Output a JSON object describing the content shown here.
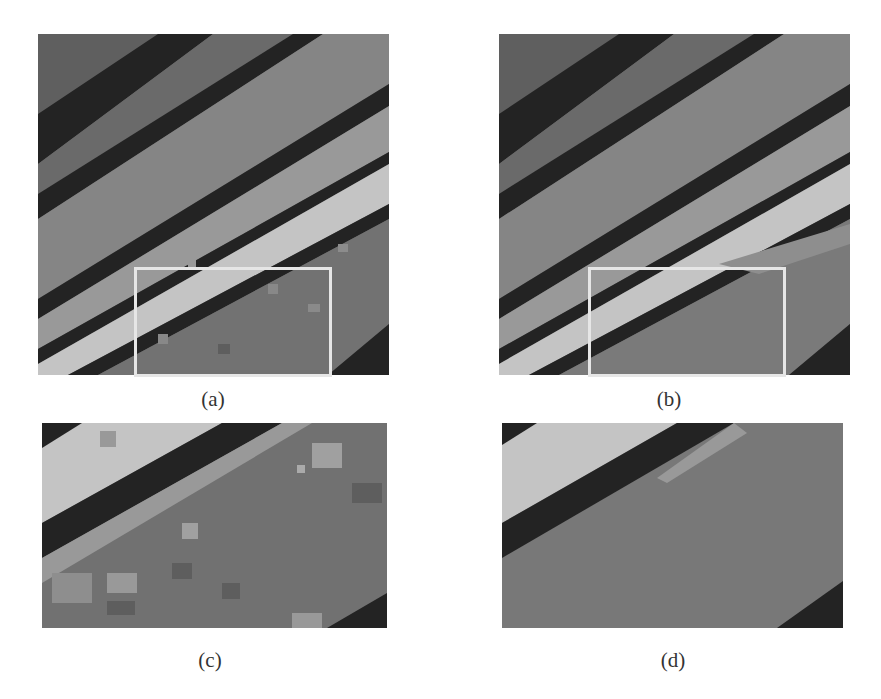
{
  "figure": {
    "panels": [
      {
        "id": "a",
        "label": "(a)",
        "description": "full segmentation map, method A"
      },
      {
        "id": "b",
        "label": "(b)",
        "description": "full segmentation map, method B"
      },
      {
        "id": "c",
        "label": "(c)",
        "description": "zoomed region of (a)"
      },
      {
        "id": "d",
        "label": "(d)",
        "description": "zoomed region of (b)"
      }
    ],
    "colors": {
      "background": "#ffffff",
      "band_black": "#232323",
      "band_dark": "#5a5a5a",
      "band_mid": "#7b7b7b",
      "band_light": "#9a9a9a",
      "band_pale": "#c4c4c4",
      "region_noisy": "#6f6f6f",
      "roi_border": "#e6e6e6"
    }
  }
}
